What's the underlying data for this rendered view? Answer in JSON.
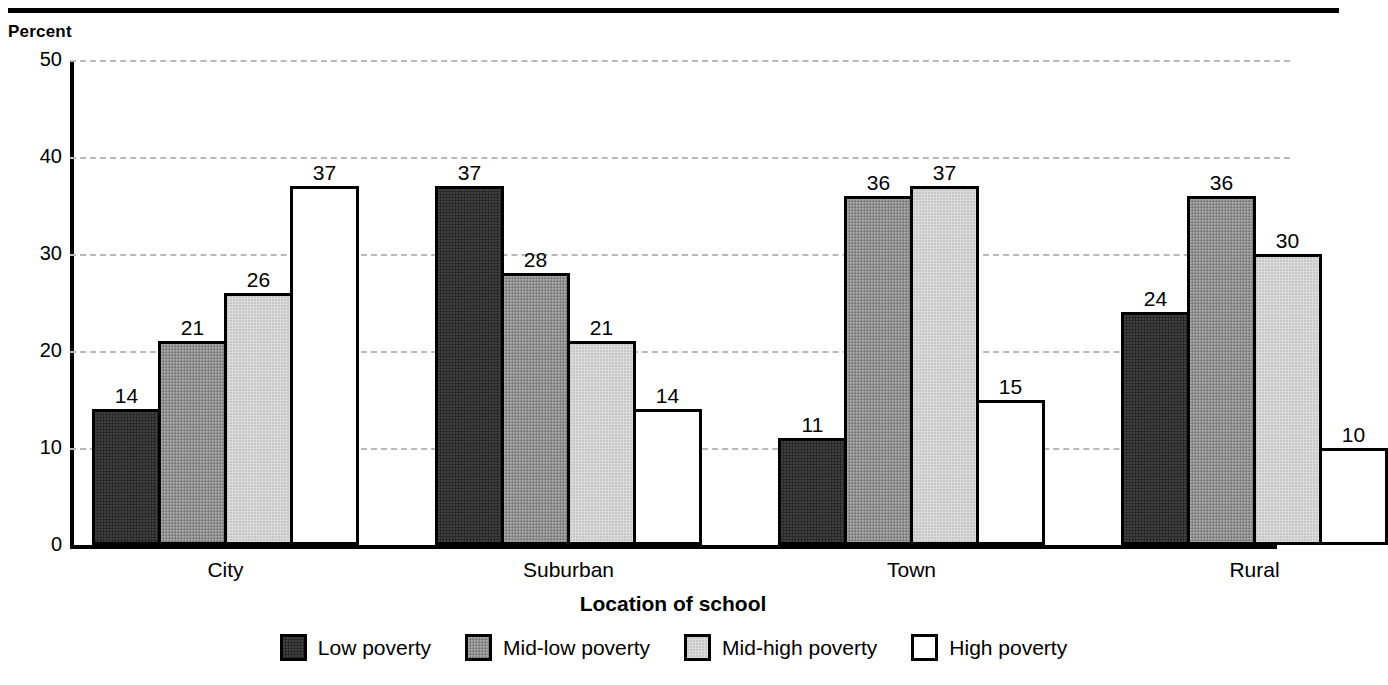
{
  "axis": {
    "y_title": "Percent",
    "x_title": "Location of school",
    "y_ticks": [
      0,
      10,
      20,
      30,
      40,
      50
    ]
  },
  "chart_data": {
    "type": "bar",
    "title": "",
    "xlabel": "Location of school",
    "ylabel": "Percent",
    "ylim": [
      0,
      50
    ],
    "grid": true,
    "legend_position": "bottom",
    "categories": [
      "City",
      "Suburban",
      "Town",
      "Rural"
    ],
    "series": [
      {
        "name": "Low poverty",
        "values": [
          14,
          37,
          11,
          24
        ],
        "color": "#282828"
      },
      {
        "name": "Mid-low poverty",
        "values": [
          21,
          28,
          36,
          36
        ],
        "color": "#8e8e8e"
      },
      {
        "name": "Mid-high poverty",
        "values": [
          26,
          21,
          37,
          30
        ],
        "color": "#dcdcdc"
      },
      {
        "name": "High poverty",
        "values": [
          37,
          14,
          15,
          10
        ],
        "color": "#ffffff"
      }
    ]
  },
  "colors": {
    "axis": "#000000",
    "gridline": "#b9b9bd",
    "background": "#ffffff"
  }
}
